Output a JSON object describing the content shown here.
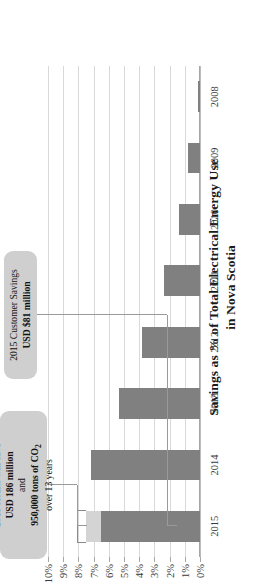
{
  "chart_data": {
    "type": "bar",
    "orientation": "horizontal-rotated",
    "title": "Savings as % of Total Electrical Energy Use",
    "title_line2": "in Nova Scotia",
    "xlabel": "",
    "ylabel": "",
    "categories": [
      "2008",
      "2009",
      "2010",
      "2011",
      "2012",
      "2013",
      "2014",
      "2015"
    ],
    "values": [
      0.15,
      0.8,
      1.4,
      2.4,
      3.8,
      5.3,
      7.2,
      7.5
    ],
    "series": [
      {
        "name": "Cumulative savings",
        "color": "#808080",
        "values": [
          0.15,
          0.8,
          1.4,
          2.4,
          3.8,
          5.3,
          7.2,
          6.5
        ]
      },
      {
        "name": "2015 increment",
        "color": "#d4d4d4",
        "values": [
          0,
          0,
          0,
          0,
          0,
          0,
          0,
          1.0
        ]
      }
    ],
    "ylim": [
      0,
      10
    ],
    "ytick_labels": [
      "10%",
      "9%",
      "8%",
      "7%",
      "6%",
      "5%",
      "4%",
      "3%",
      "2%",
      "1%",
      "0%"
    ],
    "ytick_values": [
      10,
      9,
      8,
      7,
      6,
      5,
      4,
      3,
      2,
      1,
      0
    ],
    "grid": true,
    "legend": "none",
    "annotations": [
      {
        "id": "savings-callout",
        "target_category": "2015",
        "lines": [
          {
            "text": "2015 results will save",
            "bold": false
          },
          {
            "text": "USD 186 million",
            "bold": true
          },
          {
            "text": "and",
            "bold": false
          },
          {
            "text": "950,000 tons of CO₂",
            "bold": true
          },
          {
            "text": "over 13 years",
            "bold": false
          }
        ]
      },
      {
        "id": "customer-savings-callout",
        "target_category": "2015",
        "lines": [
          {
            "text": "2015 Customer Savings",
            "bold": false
          },
          {
            "text": "USD $81 million",
            "bold": true
          }
        ]
      }
    ]
  },
  "colors": {
    "bar_base": "#808080",
    "bar_increment": "#d4d4d4",
    "callout_bg": "#cfcfcf",
    "gridline": "#d9d9d9",
    "axis": "#a6a6a6",
    "text": "#1a1a1a"
  }
}
